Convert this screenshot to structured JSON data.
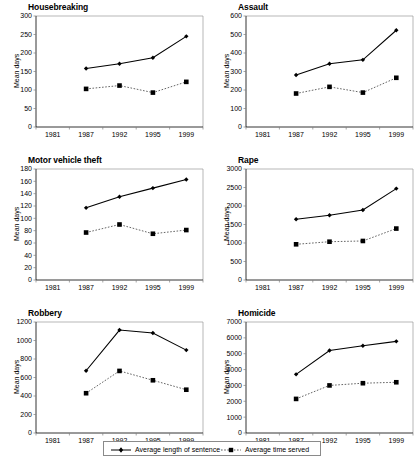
{
  "figure": {
    "axis_label": "Mean days",
    "x_ticks": [
      "1981",
      "1987",
      "1992",
      "1995",
      "1999"
    ],
    "legend": {
      "sentence_label": "Average length of sentence",
      "served_label": "Average time served",
      "sentence_marker": "diamond-marker-icon",
      "served_marker": "square-marker-icon"
    },
    "colors": {
      "sentence_line": "#000000",
      "served_line": "#555555",
      "frame": "#9a9a9a",
      "background": "#ffffff"
    }
  },
  "chart_data": [
    {
      "type": "line",
      "title": "Housebreaking",
      "xlabel": "",
      "ylabel": "Mean days",
      "x": [
        "1981",
        "1987",
        "1992",
        "1995",
        "1999"
      ],
      "ylim": [
        0,
        300
      ],
      "yticks": [
        0,
        50,
        100,
        150,
        200,
        250,
        300
      ],
      "grid": false,
      "legend_position": "below-figure",
      "series": [
        {
          "name": "Average length of sentence",
          "values": [
            null,
            158,
            171,
            187,
            245
          ]
        },
        {
          "name": "Average time served",
          "values": [
            null,
            103,
            112,
            93,
            122
          ]
        }
      ]
    },
    {
      "type": "line",
      "title": "Assault",
      "xlabel": "",
      "ylabel": "Mean days",
      "x": [
        "1981",
        "1987",
        "1992",
        "1995",
        "1999"
      ],
      "ylim": [
        0,
        600
      ],
      "yticks": [
        0,
        100,
        200,
        300,
        400,
        500,
        600
      ],
      "grid": false,
      "legend_position": "below-figure",
      "series": [
        {
          "name": "Average length of sentence",
          "values": [
            null,
            281,
            342,
            363,
            523
          ]
        },
        {
          "name": "Average time served",
          "values": [
            null,
            181,
            217,
            186,
            266
          ]
        }
      ]
    },
    {
      "type": "line",
      "title": "Motor vehicle theft",
      "xlabel": "",
      "ylabel": "Mean days",
      "x": [
        "1981",
        "1987",
        "1992",
        "1995",
        "1999"
      ],
      "ylim": [
        0,
        180
      ],
      "yticks": [
        0,
        20,
        40,
        60,
        80,
        100,
        120,
        140,
        160,
        180
      ],
      "grid": false,
      "legend_position": "below-figure",
      "series": [
        {
          "name": "Average length of sentence",
          "values": [
            null,
            117,
            135,
            149,
            163
          ]
        },
        {
          "name": "Average time served",
          "values": [
            null,
            77,
            90,
            75,
            81
          ]
        }
      ]
    },
    {
      "type": "line",
      "title": "Rape",
      "xlabel": "",
      "ylabel": "Mean days",
      "x": [
        "1981",
        "1987",
        "1992",
        "1995",
        "1999"
      ],
      "ylim": [
        0,
        3000
      ],
      "yticks": [
        0,
        500,
        1000,
        1500,
        2000,
        2500,
        3000
      ],
      "grid": false,
      "legend_position": "below-figure",
      "series": [
        {
          "name": "Average length of sentence",
          "values": [
            null,
            1640,
            1750,
            1890,
            2470
          ]
        },
        {
          "name": "Average time served",
          "values": [
            null,
            965,
            1035,
            1055,
            1390
          ]
        }
      ]
    },
    {
      "type": "line",
      "title": "Robbery",
      "xlabel": "",
      "ylabel": "Mean days",
      "x": [
        "1981",
        "1987",
        "1992",
        "1995",
        "1999"
      ],
      "ylim": [
        0,
        1200
      ],
      "yticks": [
        0,
        200,
        400,
        600,
        800,
        1000,
        1200
      ],
      "grid": false,
      "legend_position": "below-figure",
      "series": [
        {
          "name": "Average length of sentence",
          "values": [
            null,
            673,
            1113,
            1081,
            896
          ]
        },
        {
          "name": "Average time served",
          "values": [
            null,
            430,
            671,
            570,
            468
          ]
        }
      ]
    },
    {
      "type": "line",
      "title": "Homicide",
      "xlabel": "",
      "ylabel": "Mean days",
      "x": [
        "1981",
        "1987",
        "1992",
        "1995",
        "1999"
      ],
      "ylim": [
        0,
        7000
      ],
      "yticks": [
        0,
        1000,
        2000,
        3000,
        4000,
        5000,
        6000,
        7000
      ],
      "grid": false,
      "legend_position": "below-figure",
      "series": [
        {
          "name": "Average length of sentence",
          "values": [
            null,
            3700,
            5200,
            5500,
            5780
          ]
        },
        {
          "name": "Average time served",
          "values": [
            null,
            2150,
            3000,
            3140,
            3200
          ]
        }
      ]
    }
  ]
}
